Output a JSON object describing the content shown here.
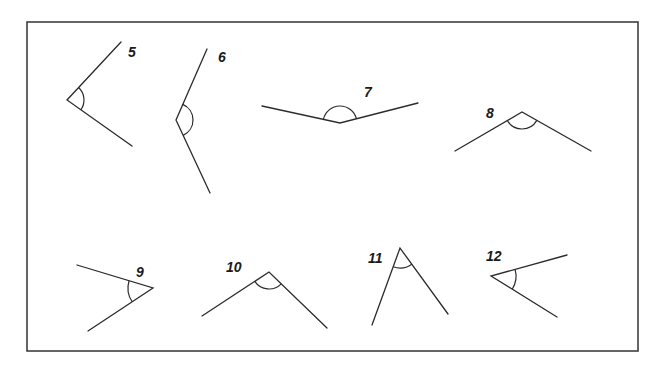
{
  "figure": {
    "angles": [
      {
        "label": "5",
        "type": "acute"
      },
      {
        "label": "6",
        "type": "obtuse"
      },
      {
        "label": "7",
        "type": "obtuse"
      },
      {
        "label": "8",
        "type": "obtuse"
      },
      {
        "label": "9",
        "type": "acute"
      },
      {
        "label": "10",
        "type": "right-or-obtuse"
      },
      {
        "label": "11",
        "type": "acute"
      },
      {
        "label": "12",
        "type": "acute"
      }
    ]
  }
}
